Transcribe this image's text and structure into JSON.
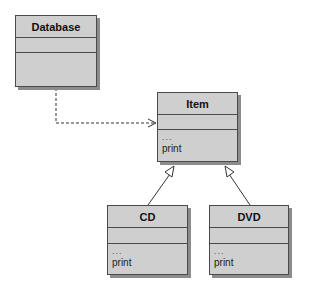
{
  "diagram": {
    "type": "uml-class-diagram",
    "classes": [
      {
        "id": "database",
        "name": "Database",
        "attributes": "",
        "operations": []
      },
      {
        "id": "item",
        "name": "Item",
        "attributes": "",
        "operations": [
          "...",
          "print"
        ]
      },
      {
        "id": "cd",
        "name": "CD",
        "attributes": "",
        "operations": [
          "...",
          "print"
        ]
      },
      {
        "id": "dvd",
        "name": "DVD",
        "attributes": "",
        "operations": [
          "...",
          "print"
        ]
      }
    ],
    "relationships": [
      {
        "from": "Database",
        "to": "Item",
        "type": "dependency",
        "style": "dashed-open-arrow"
      },
      {
        "from": "CD",
        "to": "Item",
        "type": "inheritance",
        "style": "solid-hollow-triangle"
      },
      {
        "from": "DVD",
        "to": "Item",
        "type": "inheritance",
        "style": "solid-hollow-triangle"
      }
    ],
    "colors": {
      "box_fill": "#cfcfcf",
      "border": "#4a4a4a",
      "shadow": "#8c8c8c"
    }
  }
}
